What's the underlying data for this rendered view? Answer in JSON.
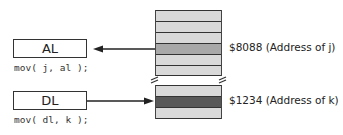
{
  "registers": [
    {
      "name": "AL",
      "instruction": "mov( j, al );"
    },
    {
      "name": "DL",
      "instruction": "mov( dl, k );"
    }
  ],
  "memory": {
    "upper_cells": [
      "normal",
      "normal",
      "normal",
      "highlight",
      "normal",
      "normal"
    ],
    "lower_cells": [
      "normal",
      "dark",
      "normal"
    ],
    "colors": {
      "normal": "#d9d9d9",
      "highlight": "#a8a8a8",
      "dark": "#585858",
      "border": "#333333"
    }
  },
  "labels": {
    "j_address": "$8088 (Address of j)",
    "k_address": "$1234 (Address of k)"
  },
  "arrows": [
    {
      "from": "memory-j",
      "to": "AL",
      "direction": "left"
    },
    {
      "from": "DL",
      "to": "memory-k",
      "direction": "right"
    }
  ]
}
